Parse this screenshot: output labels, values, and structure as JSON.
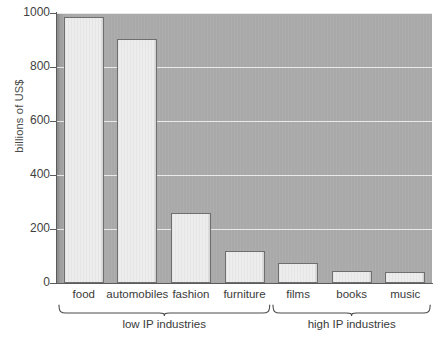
{
  "chart_data": {
    "type": "bar",
    "title": "",
    "subtitle": "",
    "xlabel": "",
    "ylabel": "billions of US$",
    "categories": [
      "food",
      "automobiles",
      "fashion",
      "furniture",
      "films",
      "books",
      "music"
    ],
    "values": [
      985,
      905,
      260,
      120,
      75,
      45,
      40
    ],
    "ylim": [
      0,
      1000
    ],
    "yticks": [
      0,
      200,
      400,
      600,
      800,
      1000
    ],
    "ytick_labels": [
      "0",
      "200",
      "400",
      "600",
      "800",
      "1000"
    ],
    "grid": "horizontal",
    "legend": "none",
    "groups": [
      {
        "label": "low IP industries",
        "categories": [
          "food",
          "automobiles",
          "fashion",
          "furniture"
        ]
      },
      {
        "label": "high IP industries",
        "categories": [
          "films",
          "books",
          "music"
        ]
      }
    ],
    "colors": {
      "plot_background": "#a9a9a9",
      "bar_fill": "#ededed",
      "bar_edge": "#6f6f6f",
      "gridline": "#ffffff",
      "axis": "#5b5b5b",
      "text": "#3a3a3a",
      "page_background": "#ffffff"
    }
  }
}
